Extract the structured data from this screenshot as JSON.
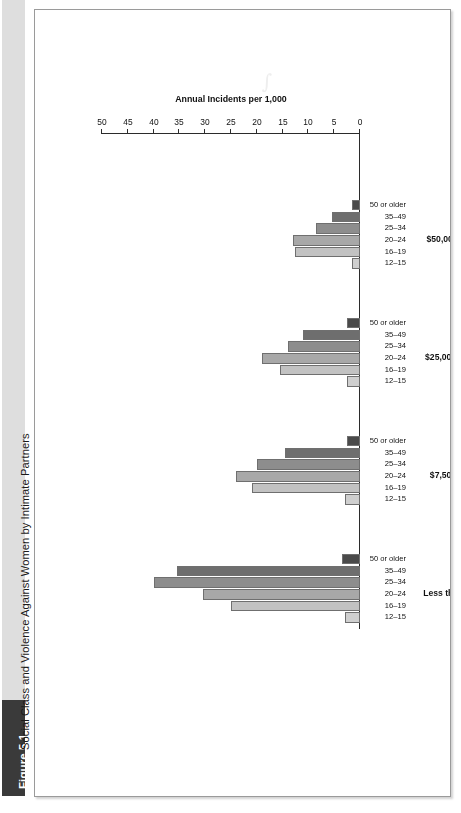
{
  "figure": {
    "badge": "Figure 5.1",
    "caption": "Social Class and Violence Against Women by Intimate Partners"
  },
  "chart_data": {
    "type": "bar",
    "orientation": "vertical",
    "title": "",
    "xlabel": "",
    "ylabel": "Annual Incidents per 1,000",
    "ylim": [
      0,
      50
    ],
    "ytick_step": 5,
    "yticks": [
      "0",
      "5",
      "10",
      "15",
      "20",
      "25",
      "30",
      "35",
      "40",
      "45",
      "50"
    ],
    "grid": false,
    "legend": "none",
    "group_label_key": "Household income",
    "categories": [
      "12–15",
      "16–19",
      "20–24",
      "25–34",
      "35–49",
      "50 or older"
    ],
    "category_colors": [
      "#cfcfcf",
      "#c2c2c2",
      "#a8a8a8",
      "#8d8d8d",
      "#6e6e6e",
      "#4a4a4a"
    ],
    "groups": [
      {
        "label": "Less than $7,500",
        "values": [
          3.0,
          25.0,
          30.5,
          40.0,
          35.5,
          3.5
        ]
      },
      {
        "label": "$7,500–$24,999",
        "values": [
          3.0,
          21.0,
          24.0,
          20.0,
          14.5,
          2.5
        ]
      },
      {
        "label": "$25,000–$49,999",
        "values": [
          2.5,
          15.5,
          19.0,
          14.0,
          11.0,
          2.5
        ]
      },
      {
        "label": "$50,000 or more",
        "values": [
          1.5,
          12.5,
          13.0,
          8.5,
          5.5,
          1.5
        ]
      }
    ]
  },
  "style": {
    "frame_border": "#9a9a9a",
    "caption_band": "#dedede",
    "badge_bg": "#3a3a3a",
    "axis_color": "#2b2b2b"
  },
  "watermark": {
    "mark": "∫"
  }
}
